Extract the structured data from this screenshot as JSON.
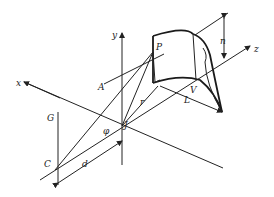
{
  "diagram": {
    "type": "3D geometry / perspective diagram",
    "axes": {
      "x": "x",
      "y": "y",
      "z": "z"
    },
    "points": {
      "P": "P",
      "A": "A",
      "J": "J",
      "C": "C",
      "G": "G",
      "V": "V"
    },
    "lengths": {
      "r": "r",
      "L": "L",
      "d": "d",
      "n": "n"
    },
    "angles": {
      "phi": "φ"
    }
  }
}
